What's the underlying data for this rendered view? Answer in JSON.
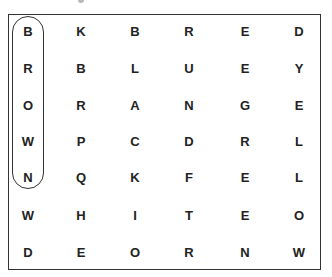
{
  "puzzle": {
    "grid": [
      [
        "B",
        "K",
        "B",
        "R",
        "E",
        "D"
      ],
      [
        "R",
        "B",
        "L",
        "U",
        "E",
        "Y"
      ],
      [
        "O",
        "R",
        "A",
        "N",
        "G",
        "E"
      ],
      [
        "W",
        "P",
        "C",
        "D",
        "R",
        "L"
      ],
      [
        "N",
        "Q",
        "K",
        "F",
        "E",
        "L"
      ],
      [
        "W",
        "H",
        "I",
        "T",
        "E",
        "O"
      ],
      [
        "D",
        "E",
        "O",
        "R",
        "N",
        "W"
      ]
    ],
    "highlighted_word": {
      "word": "BROWN",
      "column": 0,
      "start_row": 0,
      "end_row": 4
    }
  }
}
